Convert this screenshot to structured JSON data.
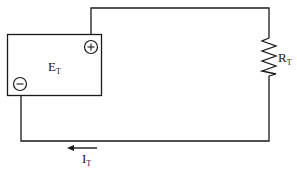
{
  "diagram": {
    "type": "series circuit",
    "colors": {
      "line": "#1a1a1a",
      "background": "#ffffff"
    },
    "source": {
      "label": "E",
      "subscript": "T",
      "positive_terminal_symbol": "+",
      "negative_terminal_symbol": "−"
    },
    "resistor": {
      "label": "R",
      "subscript": "T"
    },
    "current": {
      "label": "I",
      "subscript": "T",
      "direction": "left"
    }
  }
}
